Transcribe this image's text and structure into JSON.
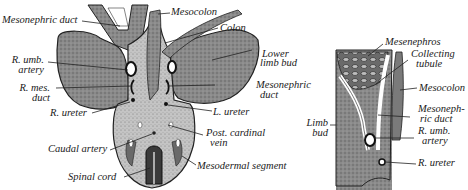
{
  "figure": {
    "left_panel": {
      "title": "Transverse section of embryo, caudal region",
      "labels": {
        "mesonephric_duct_top": "Mesonephric duct",
        "mesocolon": "Mesocolon",
        "colon": "Colon",
        "lower_limb_bud_1": "Lower",
        "lower_limb_bud_2": "limb bud",
        "r_umb_artery_1": "R. umb.",
        "r_umb_artery_2": "artery",
        "mesonephric_duct_right_1": "Mesonephric",
        "mesonephric_duct_right_2": "duct",
        "r_mes_duct_1": "R. mes.",
        "r_mes_duct_2": "duct",
        "r_ureter": "R. ureter",
        "l_ureter": "L. ureter",
        "post_cardinal_vein_1": "Post. cardinal",
        "post_cardinal_vein_2": "vein",
        "caudal_artery": "Caudal artery",
        "mesodermal_segment": "Mesodermal segment",
        "spinal_cord": "Spinal cord"
      }
    },
    "right_panel": {
      "title": "Detail of mesonephric region",
      "labels": {
        "mesenephros": "Mesenephros",
        "collecting_tubule_1": "Collecting",
        "collecting_tubule_2": "tubule",
        "mesocolon": "Mesocolon",
        "mesonephric_duct_1": "Mesoneph-",
        "mesonephric_duct_2": "ric duct",
        "r_umb_artery_1": "R. umb.",
        "r_umb_artery_2": "artery",
        "limb_bud_1": "Limb",
        "limb_bud_2": "bud",
        "r_ureter": "R. ureter"
      }
    },
    "colors": {
      "tissue_dark": "#6e6e6e",
      "tissue_mid": "#8c8c8c",
      "tissue_light": "#b4b4b4",
      "outline": "#222222",
      "background": "#ffffff"
    }
  }
}
